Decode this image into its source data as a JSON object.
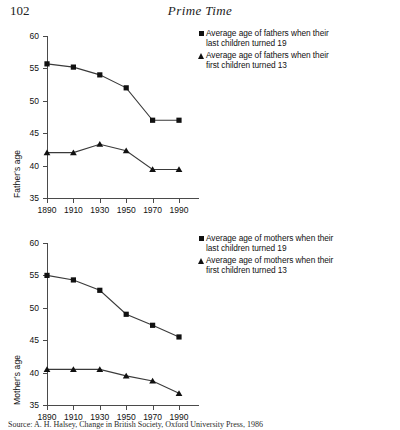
{
  "page": {
    "folio": "102",
    "running_head": "Prime Time",
    "source_note": "Source: A. H. Halsey, Change in British Society, Oxford University Press, 1986"
  },
  "charts": [
    {
      "id": "fathers",
      "ylabel": "Father's age",
      "legend": [
        {
          "marker": "square",
          "label": "Average age of fathers when their\nlast children turned 19"
        },
        {
          "marker": "triangle",
          "label": "Average age of fathers when their\nfirst children turned 13"
        }
      ],
      "chart_data": {
        "type": "line",
        "title": "",
        "xlabel": "",
        "ylabel": "Father's age",
        "categories": [
          "1890",
          "1910",
          "1930",
          "1950",
          "1970",
          "1990"
        ],
        "x": [
          1890,
          1910,
          1930,
          1950,
          1970,
          1990
        ],
        "ylim": [
          35,
          60
        ],
        "yticks": [
          35,
          40,
          45,
          50,
          55,
          60
        ],
        "grid": false,
        "legend_position": "top-right",
        "series": [
          {
            "name": "Average age of fathers when their last children turned 19",
            "marker": "square",
            "values": [
              55.7,
              55.2,
              54.0,
              52.0,
              47.0,
              47.0
            ]
          },
          {
            "name": "Average age of fathers when their first children turned 13",
            "marker": "triangle",
            "values": [
              42.0,
              42.0,
              43.3,
              42.3,
              39.4,
              39.4
            ]
          }
        ]
      }
    },
    {
      "id": "mothers",
      "ylabel": "Mother's age",
      "legend": [
        {
          "marker": "square",
          "label": "Average age of mothers when their\nlast children turned 19"
        },
        {
          "marker": "triangle",
          "label": "Average age of mothers when their\nfirst children turned 13"
        }
      ],
      "chart_data": {
        "type": "line",
        "title": "",
        "xlabel": "",
        "ylabel": "Mother's age",
        "categories": [
          "1890",
          "1910",
          "1930",
          "1950",
          "1970",
          "1990"
        ],
        "x": [
          1890,
          1910,
          1930,
          1950,
          1970,
          1990
        ],
        "ylim": [
          35,
          60
        ],
        "yticks": [
          35,
          40,
          45,
          50,
          55,
          60
        ],
        "grid": false,
        "legend_position": "top-right",
        "series": [
          {
            "name": "Average age of mothers when their last children turned 19",
            "marker": "square",
            "values": [
              55.0,
              54.3,
              52.7,
              49.0,
              47.3,
              45.5
            ]
          },
          {
            "name": "Average age of mothers when their first children turned 13",
            "marker": "triangle",
            "values": [
              40.5,
              40.5,
              40.5,
              39.5,
              38.7,
              36.8
            ]
          }
        ]
      }
    }
  ]
}
